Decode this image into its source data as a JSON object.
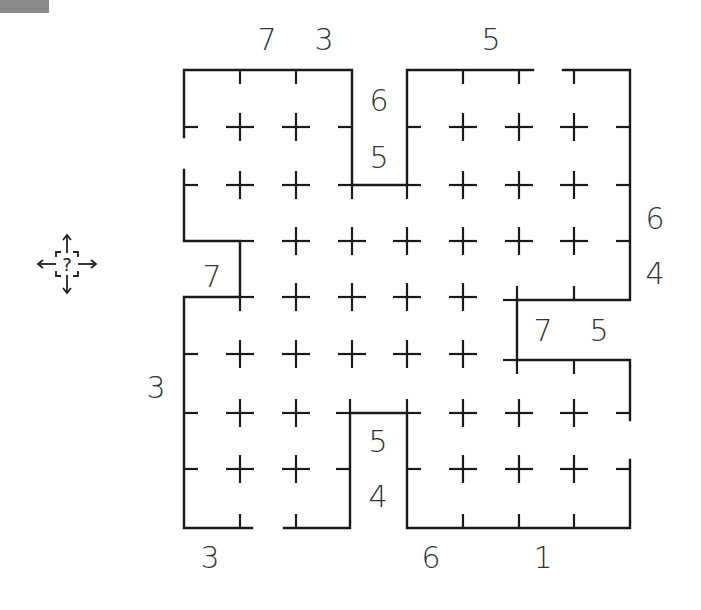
{
  "app": {
    "topbar_color": "#8a8a8a"
  },
  "puzzle": {
    "type": "grid-maze-clue-puzzle",
    "grid_cols_x": [
      184,
      240,
      296,
      351,
      407,
      463,
      519,
      574,
      630
    ],
    "grid_rows_y": [
      70,
      127,
      185,
      241,
      297,
      354,
      413,
      469,
      528
    ],
    "line_color": "#1a1a1a",
    "clues": [
      {
        "id": "top-1",
        "value": "7",
        "x": 267,
        "y": 40
      },
      {
        "id": "top-2",
        "value": "3",
        "x": 324,
        "y": 40
      },
      {
        "id": "top-3",
        "value": "5",
        "x": 491,
        "y": 40
      },
      {
        "id": "inner-top-1",
        "value": "6",
        "x": 379,
        "y": 101
      },
      {
        "id": "inner-top-2",
        "value": "5",
        "x": 379,
        "y": 158
      },
      {
        "id": "right-1",
        "value": "6",
        "x": 655,
        "y": 219
      },
      {
        "id": "right-2",
        "value": "4",
        "x": 655,
        "y": 274
      },
      {
        "id": "left-notch",
        "value": "7",
        "x": 212,
        "y": 277
      },
      {
        "id": "right-notch-1",
        "value": "7",
        "x": 543,
        "y": 331
      },
      {
        "id": "right-notch-2",
        "value": "5",
        "x": 599,
        "y": 331
      },
      {
        "id": "left-1",
        "value": "3",
        "x": 156,
        "y": 388
      },
      {
        "id": "inner-bottom-1",
        "value": "5",
        "x": 378,
        "y": 442
      },
      {
        "id": "inner-bottom-2",
        "value": "4",
        "x": 378,
        "y": 497
      },
      {
        "id": "bottom-1",
        "value": "3",
        "x": 210,
        "y": 558
      },
      {
        "id": "bottom-2",
        "value": "6",
        "x": 431,
        "y": 558
      },
      {
        "id": "bottom-3",
        "value": "1",
        "x": 543,
        "y": 558
      }
    ]
  },
  "hint_button": {
    "icon": "move-question-icon",
    "glyph": "?"
  }
}
